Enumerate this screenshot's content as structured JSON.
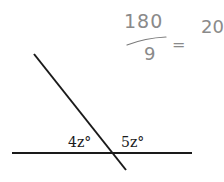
{
  "diagram": {
    "title": "",
    "lines": {
      "horizontal": {
        "x1": 12,
        "y1": 153,
        "x2": 192,
        "y2": 153,
        "color": "#1a1a1a"
      },
      "transversal": {
        "x1": 34,
        "y1": 54,
        "x2": 126,
        "y2": 170,
        "color": "#1a1a1a"
      }
    },
    "angle_labels": [
      {
        "text": "4z°",
        "x": 68,
        "y": 147
      },
      {
        "text": "5z°",
        "x": 121,
        "y": 147
      }
    ],
    "handwritten_note": {
      "numerator": "180",
      "denominator": "9",
      "equals": "=",
      "result": "20",
      "color": "#8a8a8a"
    }
  }
}
